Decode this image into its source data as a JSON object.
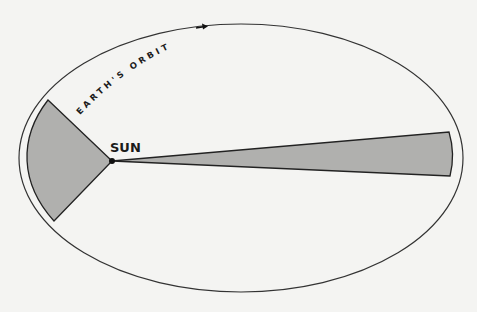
{
  "diagram": {
    "orbit_label": "EARTH'S ORBIT",
    "sun_label": "SUN",
    "colors": {
      "background": "#f4f4f2",
      "orbit_line": "#333333",
      "sector_fill": "#b0b0ae",
      "sector_edge": "#222222",
      "text": "#1a1a1a"
    }
  }
}
